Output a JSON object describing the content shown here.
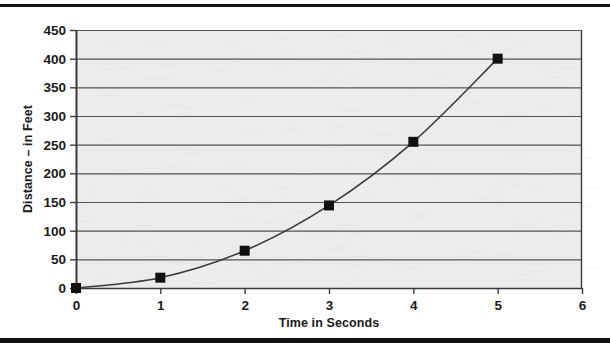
{
  "figure": {
    "background_color": "#ffffff",
    "plot_background_color": "#ececec",
    "gridline_color": "#555555",
    "axis_color": "#3b3b3b",
    "series_color": "#111111",
    "rule_color": "#141414"
  },
  "chart_data": {
    "type": "line",
    "title": "",
    "subtitle": "",
    "xlabel": "Time in Seconds",
    "ylabel": "Distance – in Feet",
    "x": [
      0,
      1,
      2,
      3,
      4,
      5
    ],
    "values": [
      0,
      18,
      65,
      144,
      255,
      400
    ],
    "series": [
      {
        "name": "Distance",
        "x": [
          0,
          1,
          2,
          3,
          4,
          5
        ],
        "values": [
          0,
          18,
          65,
          144,
          255,
          400
        ],
        "marker": "square",
        "marker_color": "#111111",
        "line_color": "#3a3a3a"
      }
    ],
    "xlim": [
      0,
      6
    ],
    "ylim": [
      0,
      450
    ],
    "xticks": [
      0,
      1,
      2,
      3,
      4,
      5,
      6
    ],
    "yticks": [
      0,
      50,
      100,
      150,
      200,
      250,
      300,
      350,
      400,
      450
    ],
    "xtick_labels": [
      "0",
      "1",
      "2",
      "3",
      "4",
      "5",
      "6"
    ],
    "ytick_labels": [
      "0",
      "50",
      "100",
      "150",
      "200",
      "250",
      "300",
      "350",
      "400",
      "450"
    ],
    "grid": "horizontal",
    "legend": "none",
    "annotations": []
  }
}
